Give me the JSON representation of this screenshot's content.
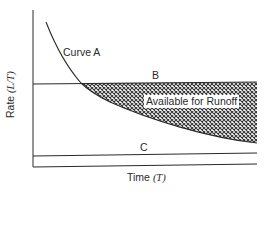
{
  "diagram": {
    "type": "infiltration-runoff-diagram",
    "axes": {
      "x_label": "Time",
      "x_unit": "(T)",
      "y_label": "Rate",
      "y_unit": "(L/T)"
    },
    "curves": [
      {
        "id": "A",
        "label": "Curve A",
        "shape": "decaying curve"
      },
      {
        "id": "B",
        "label": "B",
        "shape": "horizontal line (upper)"
      },
      {
        "id": "C",
        "label": "C",
        "shape": "horizontal line (lower)"
      }
    ],
    "region": {
      "label": "Available for Runoff",
      "fill": "crosshatch",
      "bounded_by": "Line B above, Curve A below"
    },
    "colors": {
      "line": "#2a2a2a",
      "hatch": "#333333",
      "background": "#ffffff"
    }
  }
}
